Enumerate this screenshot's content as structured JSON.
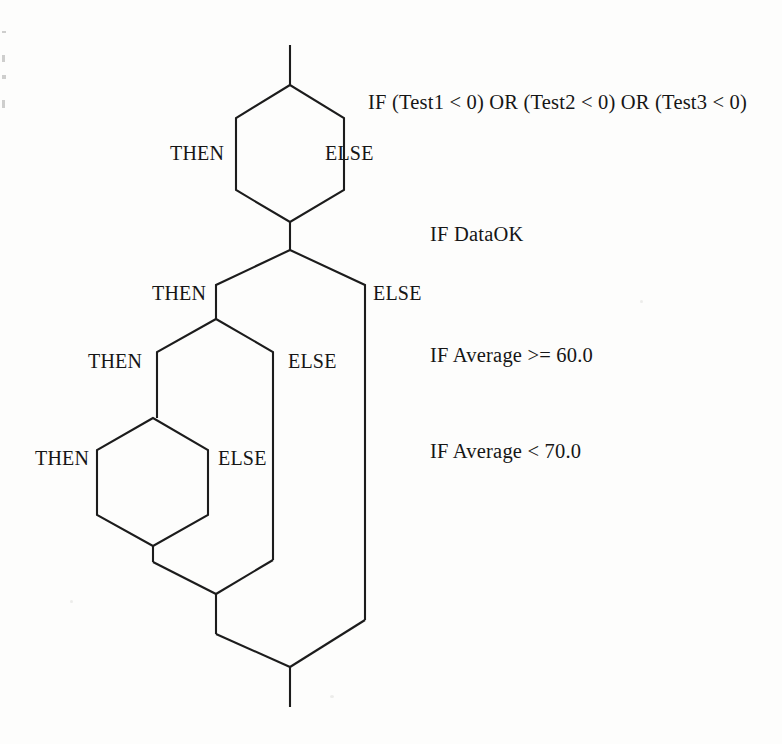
{
  "diagram": {
    "type": "flowchart",
    "stroke_color": "#1c1c1c",
    "background_color": "#fdfdfc",
    "conditions": [
      {
        "id": "cond-1",
        "text": "IF (Test1 < 0) OR (Test2 < 0) OR (Test3 < 0)",
        "x": 368,
        "y": 92
      },
      {
        "id": "cond-2",
        "text": "IF DataOK",
        "x": 430,
        "y": 224
      },
      {
        "id": "cond-3",
        "text": "IF Average >= 60.0",
        "x": 430,
        "y": 345
      },
      {
        "id": "cond-4",
        "text": "IF Average < 70.0",
        "x": 430,
        "y": 441
      }
    ],
    "branches": [
      {
        "id": "then-1",
        "text": "THEN",
        "x": 170,
        "y": 143
      },
      {
        "id": "else-1",
        "text": "ELSE",
        "x": 325,
        "y": 143
      },
      {
        "id": "then-2",
        "text": "THEN",
        "x": 152,
        "y": 283
      },
      {
        "id": "else-2",
        "text": "ELSE",
        "x": 373,
        "y": 283
      },
      {
        "id": "then-3",
        "text": "THEN",
        "x": 88,
        "y": 351
      },
      {
        "id": "else-3",
        "text": "ELSE",
        "x": 288,
        "y": 351
      },
      {
        "id": "then-4",
        "text": "THEN",
        "x": 35,
        "y": 448
      },
      {
        "id": "else-4",
        "text": "ELSE",
        "x": 218,
        "y": 448
      }
    ],
    "paths": {
      "entry_stem": "M 290 45 L 290 85",
      "hexagon_1": "M 290 85 L 236 118 L 236 190 L 290 222 L 344 190 L 344 118 Z",
      "stem_1_to_2": "M 290 222 L 290 250",
      "hexagon_2_top": "M 290 250 L 216 285 L 216 319",
      "hexagon_2_right": "M 290 250 L 365 285 L 365 620",
      "hexagon_3_top": "M 216 319 L 157 352 L 157 418",
      "hexagon_3_right": "M 216 319 L 273 352 L 273 560",
      "hexagon_4": "M 153 418 L 97 450 L 97 515 L 153 546 L 208 515 L 208 450 Z",
      "merge_4_stem": "M 153 546 L 153 562",
      "merge_3": "M 153 562 L 216 594",
      "merge_3_right_in": "M 273 560 L 216 594",
      "merge_2_stem": "M 216 594 L 216 634",
      "merge_2": "M 216 634 L 290 667",
      "merge_2_right_in": "M 365 620 L 290 667",
      "exit_stem": "M 290 667 L 290 707"
    }
  }
}
